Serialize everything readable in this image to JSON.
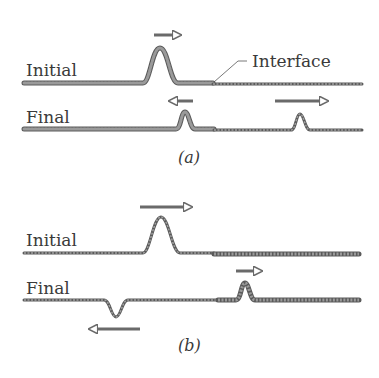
{
  "panels": [
    {
      "id": "a",
      "caption": "(a)",
      "initial_label": "Initial",
      "final_label": "Final",
      "interface_label": "Interface",
      "description": "Pulse travels from heavy (thick) string toward light (thin) string; reflected pulse upright, transmitted pulse upright"
    },
    {
      "id": "b",
      "caption": "(b)",
      "initial_label": "Initial",
      "final_label": "Final",
      "description": "Pulse travels from light (thin) string toward heavy (thick) string; reflected pulse inverted, transmitted pulse upright"
    }
  ],
  "colors": {
    "string": "#8a8a8a",
    "string_outline": "#5a5a5a",
    "arrow": "#6a6a6a",
    "text": "#3a3a3a"
  }
}
